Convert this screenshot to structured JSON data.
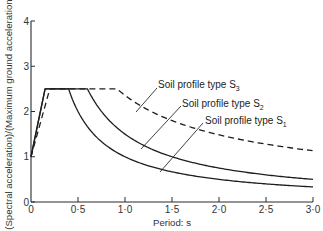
{
  "chart_data": {
    "type": "line",
    "title": "",
    "xlabel": "Period: s",
    "ylabel": "(Spectral acceleration)/(Maximum ground acceleration)",
    "xlim": [
      0,
      3.0
    ],
    "ylim": [
      0,
      4
    ],
    "grid": false,
    "legend_position": "inline-annotations",
    "x_ticks": [
      0,
      0.5,
      1.0,
      1.5,
      2.0,
      2.5,
      3.0
    ],
    "x_tick_labels": [
      "0",
      "0·5",
      "1·0",
      "1·5",
      "2·0",
      "2·5",
      "3·0"
    ],
    "y_ticks": [
      0,
      1,
      2,
      3,
      4
    ],
    "y_tick_labels": [
      "0",
      "1",
      "2",
      "3",
      "4"
    ],
    "series": [
      {
        "name": "Soil profile type S1",
        "label_main": "Soil profile type S",
        "label_sub": "1",
        "style": "solid",
        "x": [
          0,
          0.15,
          0.4,
          0.5,
          0.75,
          1.0,
          1.5,
          2.0,
          2.5,
          3.0
        ],
        "values": [
          1.0,
          2.5,
          2.5,
          2.0,
          1.33,
          1.0,
          0.67,
          0.5,
          0.4,
          0.33
        ]
      },
      {
        "name": "Soil profile type S2",
        "label_main": "Soil profile type S",
        "label_sub": "2",
        "style": "solid",
        "x": [
          0,
          0.15,
          0.6,
          0.75,
          1.0,
          1.5,
          2.0,
          2.5,
          3.0
        ],
        "values": [
          1.0,
          2.5,
          2.5,
          2.0,
          1.5,
          1.0,
          0.75,
          0.6,
          0.5
        ]
      },
      {
        "name": "Soil profile type S3",
        "label_main": "Soil profile type S",
        "label_sub": "3",
        "style": "dashed",
        "x": [
          0,
          0.2,
          0.915,
          1.0,
          1.5,
          2.0,
          2.5,
          3.0
        ],
        "values": [
          1.0,
          2.5,
          2.5,
          2.4,
          1.85,
          1.5,
          1.27,
          1.1
        ]
      }
    ]
  },
  "axes": {
    "x_title": "Period: s",
    "y_title": "(Spectral acceleration)/(Maximum ground acceleration)",
    "x_tick_labels": [
      "0",
      "0·5",
      "1·0",
      "1·5",
      "2·0",
      "2·5",
      "3·0"
    ],
    "y_tick_labels": [
      "0",
      "1",
      "2",
      "3",
      "4"
    ]
  },
  "annotations": {
    "s1": {
      "main": "Soil profile type S",
      "sub": "1"
    },
    "s2": {
      "main": "Soil profile type S",
      "sub": "2"
    },
    "s3": {
      "main": "Soil profile type S",
      "sub": "3"
    }
  }
}
